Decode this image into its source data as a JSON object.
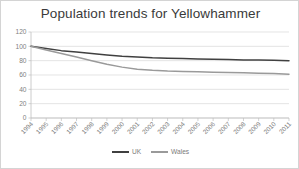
{
  "chart_data": {
    "type": "line",
    "title": "Population trends for Yellowhammer",
    "xlabel": "",
    "ylabel": "",
    "ylim": [
      0,
      120
    ],
    "yticks": [
      0,
      20,
      40,
      60,
      80,
      100,
      120
    ],
    "grid": true,
    "legend_position": "bottom",
    "categories": [
      "1994",
      "1995",
      "1996",
      "1997",
      "1998",
      "1999",
      "2000",
      "2001",
      "2002",
      "2003",
      "2004",
      "2005",
      "2006",
      "2007",
      "2008",
      "2009",
      "2010",
      "2011"
    ],
    "series": [
      {
        "name": "UK",
        "color": "#404040",
        "values": [
          100,
          97,
          94,
          92,
          90,
          88,
          86,
          85,
          84,
          83.5,
          83,
          82.5,
          82,
          81.5,
          81,
          81,
          80.5,
          80
        ]
      },
      {
        "name": "Wales",
        "color": "#9a9a9a",
        "values": [
          100,
          95,
          90,
          85,
          80,
          75,
          71,
          68,
          66.5,
          65.5,
          65,
          64.5,
          64,
          63.5,
          63,
          62.5,
          62,
          61
        ]
      }
    ]
  },
  "legend": {
    "items": [
      {
        "label": "UK",
        "color": "#404040"
      },
      {
        "label": "Wales",
        "color": "#9a9a9a"
      }
    ]
  },
  "colors": {
    "border": "#d4d4d4",
    "gridline": "#d9d9d9",
    "axis": "#bfbfbf",
    "tick_text": "#808080",
    "title_text": "#3a3a3a",
    "background": "#ffffff"
  }
}
